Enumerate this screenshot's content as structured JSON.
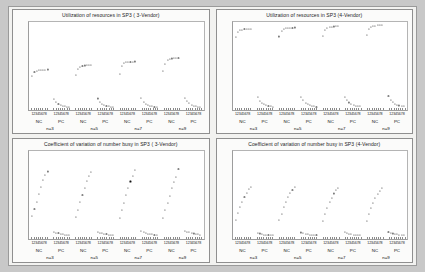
{
  "figure": {
    "background_color": "#c8c8c8",
    "panel_background": "#f2f2f0",
    "plot_background": "#ffffff",
    "point_color": "#111111"
  },
  "panels": [
    {
      "id": "utilization-3-vendor",
      "title": "Utilization of resources in SP3 ( 3-Vendor)",
      "chart_data": {
        "type": "scatter",
        "title": "Utilization of resources in SP3 ( 3-Vendor)",
        "xlabel": "",
        "ylabel": "",
        "ylim": [
          0.0,
          0.8
        ],
        "yticks": [
          "0.0",
          "0.1",
          "0.2",
          "0.3",
          "0.4",
          "0.5",
          "0.6",
          "0.7",
          "0.8"
        ],
        "ytick_values": [
          0.0,
          0.1,
          0.2,
          0.3,
          0.4,
          0.5,
          0.6,
          0.7,
          0.8
        ],
        "grid": false,
        "legend": "none",
        "groups": [
          "n=3",
          "n=5",
          "n=7",
          "n=9"
        ],
        "subgroups": [
          "NC",
          "PC"
        ],
        "xtick_labels": [
          "1",
          "2",
          "3",
          "4",
          "5",
          "6",
          "7",
          "8"
        ],
        "series": [
          {
            "name": "NC-upper",
            "group": "n=3",
            "values": [
              0.305,
              0.347,
              0.358,
              0.362,
              0.365,
              0.366,
              0.367,
              0.368
            ]
          },
          {
            "name": "PC-lower",
            "group": "n=3",
            "values": [
              0.102,
              0.072,
              0.055,
              0.044,
              0.037,
              0.032,
              0.028,
              0.025
            ]
          },
          {
            "name": "NC-upper",
            "group": "n=5",
            "values": [
              0.318,
              0.372,
              0.392,
              0.4,
              0.404,
              0.406,
              0.407,
              0.408
            ]
          },
          {
            "name": "PC-lower",
            "group": "n=5",
            "values": [
              0.104,
              0.074,
              0.057,
              0.046,
              0.038,
              0.033,
              0.029,
              0.026
            ]
          },
          {
            "name": "NC-upper",
            "group": "n=7",
            "values": [
              0.33,
              0.398,
              0.423,
              0.432,
              0.437,
              0.439,
              0.44,
              0.441
            ]
          },
          {
            "name": "PC-lower",
            "group": "n=7",
            "values": [
              0.106,
              0.076,
              0.058,
              0.047,
              0.039,
              0.034,
              0.03,
              0.027
            ]
          },
          {
            "name": "NC-upper",
            "group": "n=9",
            "values": [
              0.352,
              0.42,
              0.452,
              0.463,
              0.468,
              0.47,
              0.472,
              0.473
            ]
          },
          {
            "name": "PC-lower",
            "group": "n=9",
            "values": [
              0.108,
              0.078,
              0.06,
              0.048,
              0.04,
              0.035,
              0.031,
              0.028
            ]
          }
        ]
      }
    },
    {
      "id": "utilization-4-vendor",
      "title": "Utilization of resources in SP3 (4-Vendor)",
      "chart_data": {
        "type": "scatter",
        "title": "Utilization of resources in SP3 (4-Vendor)",
        "xlabel": "",
        "ylabel": "",
        "ylim": [
          0.0,
          0.8
        ],
        "yticks": [
          "0.0",
          "0.1",
          "0.2",
          "0.3",
          "0.4",
          "0.5",
          "0.6",
          "0.7",
          "0.8"
        ],
        "ytick_values": [
          0.0,
          0.1,
          0.2,
          0.3,
          0.4,
          0.5,
          0.6,
          0.7,
          0.8
        ],
        "grid": false,
        "legend": "none",
        "groups": [
          "n=3",
          "n=5",
          "n=7",
          "n=9"
        ],
        "subgroups": [
          "NC",
          "PC"
        ],
        "xtick_labels": [
          "1",
          "2",
          "3",
          "4",
          "5",
          "6",
          "7",
          "8"
        ],
        "series": [
          {
            "name": "NC-upper",
            "group": "n=3",
            "values": [
              0.66,
              0.712,
              0.726,
              0.731,
              0.733,
              0.735,
              0.736,
              0.737
            ]
          },
          {
            "name": "PC-lower",
            "group": "n=3",
            "values": [
              0.118,
              0.085,
              0.065,
              0.052,
              0.044,
              0.038,
              0.033,
              0.03
            ]
          },
          {
            "name": "NC-upper",
            "group": "n=5",
            "values": [
              0.668,
              0.722,
              0.738,
              0.744,
              0.747,
              0.748,
              0.749,
              0.75
            ]
          },
          {
            "name": "PC-lower",
            "group": "n=5",
            "values": [
              0.12,
              0.087,
              0.067,
              0.054,
              0.045,
              0.039,
              0.034,
              0.031
            ]
          },
          {
            "name": "NC-upper",
            "group": "n=7",
            "values": [
              0.676,
              0.73,
              0.748,
              0.754,
              0.757,
              0.759,
              0.76,
              0.761
            ]
          },
          {
            "name": "PC-lower",
            "group": "n=7",
            "values": [
              0.122,
              0.089,
              0.068,
              0.055,
              0.046,
              0.04,
              0.035,
              0.032
            ]
          },
          {
            "name": "NC-upper",
            "group": "n=9",
            "values": [
              0.684,
              0.738,
              0.757,
              0.764,
              0.767,
              0.769,
              0.77,
              0.771
            ]
          },
          {
            "name": "PC-lower",
            "group": "n=9",
            "values": [
              0.124,
              0.091,
              0.07,
              0.056,
              0.047,
              0.041,
              0.036,
              0.033
            ]
          }
        ]
      }
    },
    {
      "id": "cv-3-vendor",
      "title": "Coefficient of variation of number busy in SP3 ( 3-Vendor)",
      "chart_data": {
        "type": "scatter",
        "title": "Coefficient of variation of number busy in SP3 ( 3-Vendor)",
        "xlabel": "",
        "ylabel": "",
        "ylim": [
          0,
          6
        ],
        "yticks": [
          "0",
          "1",
          "2",
          "3",
          "4",
          "5",
          "6"
        ],
        "ytick_values": [
          0,
          1,
          2,
          3,
          4,
          5,
          6
        ],
        "grid": false,
        "legend": "none",
        "groups": [
          "n=3",
          "n=5",
          "n=7",
          "n=9"
        ],
        "subgroups": [
          "NC",
          "PC"
        ],
        "xtick_labels": [
          "1",
          "2",
          "3",
          "4",
          "5",
          "6",
          "7",
          "8"
        ],
        "series": [
          {
            "name": "NC-ramp",
            "group": "n=3",
            "values": [
              1.55,
              2.05,
              2.55,
              3.05,
              3.55,
              4.0,
              4.35,
              4.6
            ]
          },
          {
            "name": "PC-low",
            "group": "n=3",
            "values": [
              0.48,
              0.42,
              0.38,
              0.34,
              0.31,
              0.29,
              0.27,
              0.26
            ]
          },
          {
            "name": "NC-ramp",
            "group": "n=5",
            "values": [
              1.5,
              2.0,
              2.5,
              3.0,
              3.5,
              3.95,
              4.3,
              4.58
            ]
          },
          {
            "name": "PC-low",
            "group": "n=5",
            "values": [
              0.5,
              0.43,
              0.39,
              0.35,
              0.32,
              0.3,
              0.28,
              0.27
            ]
          },
          {
            "name": "NC-ramp",
            "group": "n=7",
            "values": [
              1.45,
              1.98,
              2.48,
              2.98,
              3.48,
              3.92,
              4.28,
              4.72
            ]
          },
          {
            "name": "PC-low",
            "group": "n=7",
            "values": [
              0.52,
              0.45,
              0.4,
              0.36,
              0.33,
              0.31,
              0.29,
              0.28
            ]
          },
          {
            "name": "NC-ramp",
            "group": "n=9",
            "values": [
              1.42,
              1.95,
              2.45,
              2.95,
              3.45,
              3.9,
              4.25,
              4.8
            ]
          },
          {
            "name": "PC-low",
            "group": "n=9",
            "values": [
              0.55,
              0.5,
              0.45,
              0.41,
              0.37,
              0.34,
              0.32,
              0.3
            ]
          }
        ]
      }
    },
    {
      "id": "cv-4-vendor",
      "title": "Coefficient of variation of number busy in SP3 (4-Vendor)",
      "chart_data": {
        "type": "scatter",
        "title": "Coefficient of variation of number busy in SP3 (4-Vendor)",
        "xlabel": "",
        "ylabel": "",
        "ylim": [
          0,
          6
        ],
        "yticks": [
          "0",
          "1",
          "2",
          "3",
          "4",
          "5",
          "6"
        ],
        "ytick_values": [
          0,
          1,
          2,
          3,
          4,
          5,
          6
        ],
        "grid": false,
        "legend": "none",
        "groups": [
          "n=3",
          "n=5",
          "n=7",
          "n=9"
        ],
        "subgroups": [
          "NC",
          "PC"
        ],
        "xtick_labels": [
          "1",
          "2",
          "3",
          "4",
          "5",
          "6",
          "7",
          "8"
        ],
        "series": [
          {
            "name": "NC-ramp",
            "group": "n=3",
            "values": [
              1.3,
              1.75,
              2.18,
              2.55,
              2.88,
              3.15,
              3.38,
              3.55
            ]
          },
          {
            "name": "PC-low",
            "group": "n=3",
            "values": [
              0.42,
              0.37,
              0.33,
              0.3,
              0.28,
              0.26,
              0.25,
              0.24
            ]
          },
          {
            "name": "NC-ramp",
            "group": "n=5",
            "values": [
              1.28,
              1.72,
              2.15,
              2.52,
              2.85,
              3.12,
              3.35,
              3.52
            ]
          },
          {
            "name": "PC-low",
            "group": "n=5",
            "values": [
              0.44,
              0.38,
              0.34,
              0.31,
              0.29,
              0.27,
              0.26,
              0.25
            ]
          },
          {
            "name": "NC-ramp",
            "group": "n=7",
            "values": [
              1.25,
              1.7,
              2.12,
              2.5,
              2.82,
              3.1,
              3.32,
              3.5
            ]
          },
          {
            "name": "PC-low",
            "group": "n=7",
            "values": [
              0.46,
              0.4,
              0.35,
              0.32,
              0.3,
              0.28,
              0.27,
              0.26
            ]
          },
          {
            "name": "NC-ramp",
            "group": "n=9",
            "values": [
              1.22,
              1.68,
              2.1,
              2.48,
              2.8,
              3.08,
              3.3,
              3.48
            ]
          },
          {
            "name": "PC-low",
            "group": "n=9",
            "values": [
              0.48,
              0.42,
              0.37,
              0.34,
              0.31,
              0.29,
              0.28,
              0.27
            ]
          }
        ]
      }
    }
  ]
}
